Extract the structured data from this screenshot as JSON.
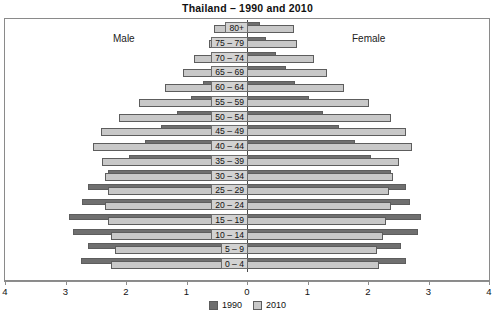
{
  "chart_data": {
    "type": "bar",
    "subtype": "population-pyramid",
    "title": "Thailand – 1990 and 2010",
    "xlabel": "",
    "ylabel": "",
    "xlim": [
      -4,
      4
    ],
    "xticks": [
      4,
      3,
      2,
      1,
      0,
      1,
      2,
      3,
      4
    ],
    "xtick_labels": [
      "4",
      "3",
      "2",
      "1",
      "0",
      "1",
      "2",
      "3",
      "4"
    ],
    "grid": false,
    "legend_position": "bottom-center",
    "side_labels": {
      "left": "Male",
      "right": "Female"
    },
    "categories": [
      "80+",
      "75 – 79",
      "70 – 74",
      "65 – 69",
      "60 – 64",
      "55 – 59",
      "50 – 54",
      "45 – 49",
      "40 – 44",
      "35 – 39",
      "30 – 34",
      "25 – 29",
      "20 – 24",
      "15 – 19",
      "10 – 14",
      "5 – 9",
      "0 – 4"
    ],
    "series": [
      {
        "name": "1990",
        "color": "#6f6f6f",
        "male": [
          0.18,
          0.28,
          0.42,
          0.58,
          0.72,
          0.92,
          1.15,
          1.42,
          1.68,
          1.95,
          2.3,
          2.62,
          2.72,
          2.95,
          2.88,
          2.62,
          2.75
        ],
        "female": [
          0.22,
          0.32,
          0.48,
          0.65,
          0.8,
          1.02,
          1.25,
          1.52,
          1.78,
          2.05,
          2.38,
          2.62,
          2.7,
          2.88,
          2.82,
          2.55,
          2.62
        ]
      },
      {
        "name": "2010",
        "color": "#c8c8c8",
        "male": [
          0.55,
          0.62,
          0.88,
          1.05,
          1.35,
          1.78,
          2.12,
          2.42,
          2.55,
          2.4,
          2.35,
          2.3,
          2.35,
          2.3,
          2.25,
          2.18,
          2.25
        ],
        "female": [
          0.78,
          0.82,
          1.1,
          1.32,
          1.6,
          2.02,
          2.38,
          2.62,
          2.72,
          2.52,
          2.42,
          2.35,
          2.38,
          2.3,
          2.25,
          2.15,
          2.18
        ]
      }
    ]
  },
  "legend": [
    {
      "label": "1990",
      "color": "#6f6f6f"
    },
    {
      "label": "2010",
      "color": "#c8c8c8"
    }
  ]
}
